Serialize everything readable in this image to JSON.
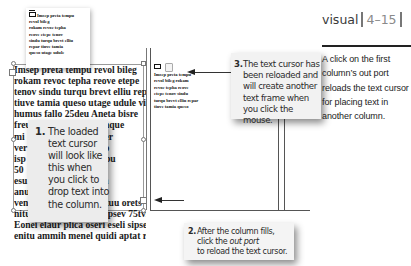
{
  "header": {
    "section_label": "visual",
    "figure_number": "4–15"
  },
  "caption": {
    "text": "A click on the first column’s out port reloads the text cursor for placing text in another column."
  },
  "loaded_cursor_thumbnail": {
    "lines": [
      "Imsep preta tempu",
      "revol bileg",
      "rokam revoc tepha",
      "reove etepe tenov",
      "sindu turqu brevt elliu",
      "repar tiuve tamia",
      "queso utage udule"
    ]
  },
  "column1": {
    "lines": [
      "Imsep preta tempu revol bileg",
      "rokam revoc tepha reove etepe",
      "tenov sindu turqu brevt elliu repar",
      "tiuve tamia queso utage udule vires",
      "humus fallo 25deu Aneta bisre",
      "freum                          taque",
      "mi                              mer",
      "ver                        r billo",
      "isp                        os itopu",
      "50                            tec",
      "esu                         soma",
      "anu                          ofe",
      "ventu nupeo oramo uetuu orets",
      "nitus sacer tusag teliu ipsev 75tvi",
      "Eonei elaur plica oseri eseli sipse",
      "enitu ammih menel quidi aptat rinar"
    ]
  },
  "loaded_cursor_column2": {
    "lines": [
      "Imsep preta tempu",
      "revol bileg rokam",
      "revoc tepha reove",
      "etepe tenov sindu",
      "turqu brevt elliu repar",
      "tiuve tamia queso"
    ]
  },
  "callouts": [
    {
      "number": "1.",
      "text": "The loaded text cursor will look like this when you click to drop text into the column."
    },
    {
      "number": "2.",
      "line1": "After the column fills,",
      "line2_prefix": "click the ",
      "line2_em": "out port",
      "line3": "to reload the text cursor."
    },
    {
      "number": "3.",
      "text": "The text cursor has been reloaded and will create another text frame when you click the mouse."
    }
  ]
}
